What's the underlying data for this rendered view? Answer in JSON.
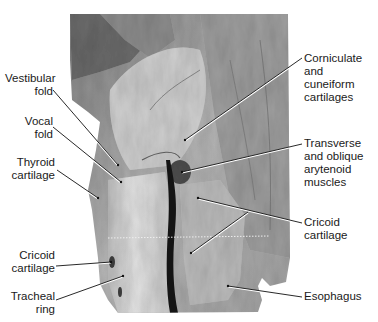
{
  "figure": {
    "background": "#ffffff",
    "label_color": "#1a1a1a",
    "leader_line_color": "#111111",
    "labels_left": [
      {
        "id": "vestibular-fold",
        "text": "Vestibular\nfold",
        "x": 5,
        "y": 72,
        "w": 48
      },
      {
        "id": "vocal-fold",
        "text": "Vocal\nfold",
        "x": 5,
        "y": 115,
        "w": 48
      },
      {
        "id": "thyroid-cartilage",
        "text": "Thyroid\ncartilage",
        "x": 5,
        "y": 156,
        "w": 52
      },
      {
        "id": "cricoid-cartilage-left",
        "text": "Cricoid\ncartilage",
        "x": 5,
        "y": 249,
        "w": 52
      },
      {
        "id": "tracheal-ring",
        "text": "Tracheal\nring",
        "x": 5,
        "y": 290,
        "w": 52
      }
    ],
    "labels_right": [
      {
        "id": "corniculate-cuneiform",
        "text": "Corniculate and\ncuneiform\ncartilages",
        "x": 304,
        "y": 52
      },
      {
        "id": "arytenoid-muscles",
        "text": "Transverse\nand oblique\narytenoid\nmuscles",
        "x": 304,
        "y": 137
      },
      {
        "id": "cricoid-cartilage-right",
        "text": "Cricoid\ncartilage",
        "x": 304,
        "y": 216
      },
      {
        "id": "esophagus",
        "text": "Esophagus",
        "x": 304,
        "y": 290
      }
    ],
    "leader_lines": [
      {
        "id": "vestibular-fold",
        "x1": 53,
        "y1": 90,
        "x2": 118,
        "y2": 165
      },
      {
        "id": "vocal-fold",
        "x1": 53,
        "y1": 127,
        "x2": 121,
        "y2": 182
      },
      {
        "id": "thyroid-cartilage",
        "x1": 57,
        "y1": 170,
        "x2": 98,
        "y2": 198
      },
      {
        "id": "cricoid-cartilage-left",
        "x1": 56,
        "y1": 266,
        "x2": 111,
        "y2": 262
      },
      {
        "id": "tracheal-ring",
        "x1": 56,
        "y1": 300,
        "x2": 123,
        "y2": 276
      },
      {
        "id": "corniculate-cuneiform",
        "x1": 302,
        "y1": 58,
        "x2": 185,
        "y2": 140
      },
      {
        "id": "arytenoid-muscles",
        "x1": 302,
        "y1": 144,
        "x2": 182,
        "y2": 172
      },
      {
        "id": "cricoid-cartilage-right",
        "x1": 302,
        "y1": 223,
        "x2": 198,
        "y2": 198
      },
      {
        "id": "cricoid-cartilage-right-branch",
        "x1": 248,
        "y1": 212,
        "x2": 191,
        "y2": 253
      },
      {
        "id": "esophagus",
        "x1": 302,
        "y1": 297,
        "x2": 228,
        "y2": 286
      }
    ]
  }
}
